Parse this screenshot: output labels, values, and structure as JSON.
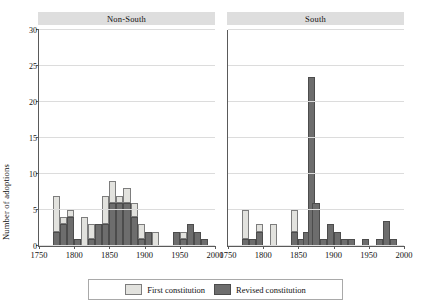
{
  "chart_data": {
    "type": "bar",
    "title": "",
    "subtitle": "",
    "xlabel": "",
    "ylabel": "Number of adoptions",
    "xlim": [
      1750,
      2000
    ],
    "ylim": [
      0,
      30
    ],
    "bin_width": 10,
    "grid": true,
    "stacked": true,
    "legend_position": "bottom",
    "legend": [
      {
        "name": "First constitution",
        "color": "#e2e2de"
      },
      {
        "name": "Revised constitution",
        "color": "#6d6d6d"
      }
    ],
    "y_ticks": [
      0,
      5,
      10,
      15,
      20,
      25,
      30
    ],
    "x_ticks": [
      1750,
      1800,
      1850,
      1900,
      1950,
      2000
    ],
    "panels": [
      {
        "label": "Non-South",
        "bins": [
          {
            "x": 1775,
            "first": 5,
            "revised": 2
          },
          {
            "x": 1785,
            "first": 1,
            "revised": 3
          },
          {
            "x": 1795,
            "first": 1,
            "revised": 4
          },
          {
            "x": 1805,
            "first": 0,
            "revised": 1
          },
          {
            "x": 1815,
            "first": 4,
            "revised": 0
          },
          {
            "x": 1825,
            "first": 2,
            "revised": 1
          },
          {
            "x": 1835,
            "first": 0,
            "revised": 3
          },
          {
            "x": 1845,
            "first": 4,
            "revised": 3
          },
          {
            "x": 1855,
            "first": 3,
            "revised": 6
          },
          {
            "x": 1865,
            "first": 1,
            "revised": 6
          },
          {
            "x": 1875,
            "first": 2,
            "revised": 6
          },
          {
            "x": 1885,
            "first": 2,
            "revised": 4
          },
          {
            "x": 1895,
            "first": 2,
            "revised": 1
          },
          {
            "x": 1905,
            "first": 0,
            "revised": 2
          },
          {
            "x": 1915,
            "first": 2,
            "revised": 0
          },
          {
            "x": 1945,
            "first": 0,
            "revised": 2
          },
          {
            "x": 1955,
            "first": 1,
            "revised": 1
          },
          {
            "x": 1965,
            "first": 0,
            "revised": 3
          },
          {
            "x": 1975,
            "first": 0,
            "revised": 2
          },
          {
            "x": 1985,
            "first": 0,
            "revised": 1
          }
        ]
      },
      {
        "label": "South",
        "bins": [
          {
            "x": 1775,
            "first": 4,
            "revised": 1
          },
          {
            "x": 1785,
            "first": 0,
            "revised": 1
          },
          {
            "x": 1795,
            "first": 1,
            "revised": 2
          },
          {
            "x": 1815,
            "first": 3,
            "revised": 0
          },
          {
            "x": 1845,
            "first": 3,
            "revised": 2
          },
          {
            "x": 1855,
            "first": 0,
            "revised": 1
          },
          {
            "x": 1862,
            "first": 0,
            "revised": 2
          },
          {
            "x": 1868,
            "first": 0,
            "revised": 23.5
          },
          {
            "x": 1875,
            "first": 0,
            "revised": 6
          },
          {
            "x": 1885,
            "first": 0,
            "revised": 1
          },
          {
            "x": 1895,
            "first": 0,
            "revised": 3
          },
          {
            "x": 1905,
            "first": 0,
            "revised": 2
          },
          {
            "x": 1915,
            "first": 0,
            "revised": 1
          },
          {
            "x": 1925,
            "first": 0,
            "revised": 1
          },
          {
            "x": 1945,
            "first": 0,
            "revised": 1
          },
          {
            "x": 1965,
            "first": 0,
            "revised": 1
          },
          {
            "x": 1975,
            "first": 0,
            "revised": 3.5
          },
          {
            "x": 1985,
            "first": 0,
            "revised": 1
          }
        ]
      }
    ]
  }
}
